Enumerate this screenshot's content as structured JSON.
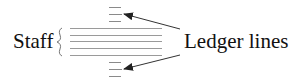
{
  "labels": {
    "staff": "Staff",
    "ledger": "Ledger lines"
  },
  "colors": {
    "line": "#8a8a8a",
    "ink": "#222222"
  }
}
